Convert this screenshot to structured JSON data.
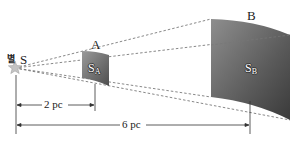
{
  "diagram": {
    "source": {
      "symbol": "S",
      "korean_label": "별"
    },
    "surfaces": [
      {
        "name": "A",
        "area_label_main": "S",
        "area_label_sub": "A"
      },
      {
        "name": "B",
        "area_label_main": "S",
        "area_label_sub": "B"
      }
    ],
    "distances": [
      {
        "label": "2 pc",
        "from": "S",
        "to": "A"
      },
      {
        "label": "6 pc",
        "from": "S",
        "to": "B"
      }
    ],
    "colors": {
      "surface_dark": "#4a4a4a",
      "surface_light": "#8a8a8a",
      "star": "#b8b8b8",
      "ray": "#666666",
      "line": "#333333"
    }
  }
}
